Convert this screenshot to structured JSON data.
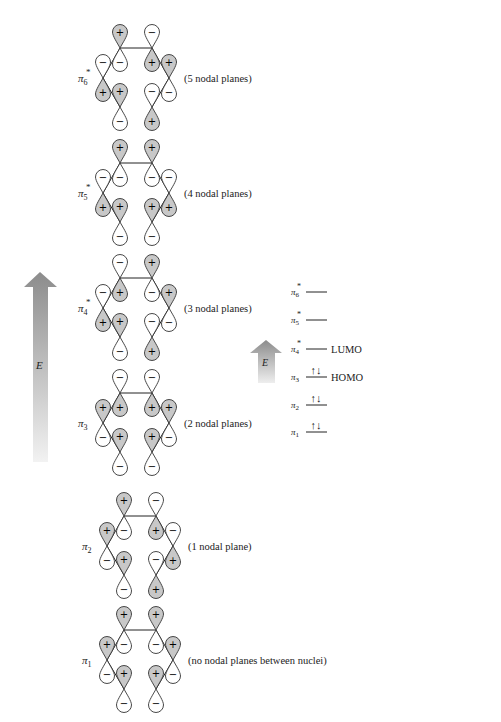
{
  "figure": {
    "energy_axis_label": "E",
    "orbitals": [
      {
        "id": "pi6",
        "label": "π",
        "sub": "6",
        "star": true,
        "note": "(5 nodal planes)",
        "signs": [
          "+",
          "-",
          "+",
          "-",
          "+",
          "-"
        ]
      },
      {
        "id": "pi5",
        "label": "π",
        "sub": "5",
        "star": true,
        "note": "(4 nodal planes)",
        "signs": [
          "+",
          "-",
          "+",
          "+",
          "-",
          "+"
        ]
      },
      {
        "id": "pi4",
        "label": "π",
        "sub": "4",
        "star": true,
        "note": "(3 nodal planes)",
        "signs": [
          "+",
          "-",
          "-",
          "+",
          "+",
          "-"
        ]
      },
      {
        "id": "pi3",
        "label": "π",
        "sub": "3",
        "star": false,
        "note": "(2 nodal planes)",
        "signs": [
          "+",
          "+",
          "-",
          "-",
          "+",
          "+"
        ]
      },
      {
        "id": "pi2",
        "label": "π",
        "sub": "2",
        "star": false,
        "note": "(1 nodal plane)",
        "signs": [
          "+",
          "+",
          "+",
          "-",
          "-",
          "-"
        ]
      },
      {
        "id": "pi1",
        "label": "π",
        "sub": "1",
        "star": false,
        "note": "(no nodal planes between nuclei)",
        "signs": [
          "+",
          "+",
          "+",
          "+",
          "+",
          "+"
        ]
      }
    ],
    "atom_order_note": "signs list upper-lobe sign for atoms: bottom-left, left, top-left, top-right, right, bottom-right"
  },
  "energy_diagram": {
    "axis_label": "E",
    "levels": [
      {
        "label": "π",
        "sub": "6",
        "star": true,
        "electrons": "",
        "tag": ""
      },
      {
        "label": "π",
        "sub": "5",
        "star": true,
        "electrons": "",
        "tag": ""
      },
      {
        "label": "π",
        "sub": "4",
        "star": true,
        "electrons": "",
        "tag": "LUMO"
      },
      {
        "label": "π",
        "sub": "3",
        "star": false,
        "electrons": "↑↓",
        "tag": "HOMO"
      },
      {
        "label": "π",
        "sub": "2",
        "star": false,
        "electrons": "↑↓",
        "tag": ""
      },
      {
        "label": "π",
        "sub": "1",
        "star": false,
        "electrons": "↑↓",
        "tag": ""
      }
    ]
  },
  "colors": {
    "lobe_shaded": "#c8c8c8",
    "lobe_outline": "#333333",
    "arrow_top": "#8a8a8a",
    "arrow_bottom": "#f0f0f0"
  }
}
